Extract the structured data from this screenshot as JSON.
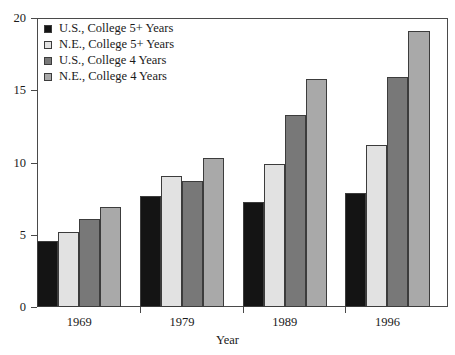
{
  "chart_data": {
    "type": "bar",
    "title": "",
    "subtitle": "",
    "xlabel": "Year",
    "ylabel": "",
    "categories": [
      "1969",
      "1979",
      "1989",
      "1996"
    ],
    "series": [
      {
        "name": "U.S., College 5+ Years",
        "color": "#141414",
        "values": [
          4.6,
          7.7,
          7.3,
          7.9
        ]
      },
      {
        "name": "N.E., College 5+ Years",
        "color": "#e2e2e2",
        "values": [
          5.2,
          9.1,
          9.9,
          11.2
        ]
      },
      {
        "name": "U.S., College 4 Years",
        "color": "#787878",
        "values": [
          6.1,
          8.7,
          13.3,
          15.9
        ]
      },
      {
        "name": "N.E., College 4 Years",
        "color": "#a9a9a9",
        "values": [
          6.9,
          10.3,
          15.8,
          19.1
        ]
      }
    ],
    "ylim": [
      0,
      20
    ],
    "y_ticks": [
      "0",
      "5",
      "10",
      "15",
      "20"
    ],
    "y_tick_values": [
      0,
      5,
      10,
      15,
      20
    ],
    "grid": false,
    "legend_position": "top-left",
    "bar_border_color": "#3c3c3c",
    "frame_color": "#4a4a4a"
  },
  "legend": {
    "items": [
      {
        "label": "U.S., College 5+ Years"
      },
      {
        "label": "N.E., College 5+ Years"
      },
      {
        "label": "U.S., College 4 Years"
      },
      {
        "label": "N.E., College 4 Years"
      }
    ]
  },
  "axes": {
    "x_title": "Year",
    "y_title": ""
  }
}
